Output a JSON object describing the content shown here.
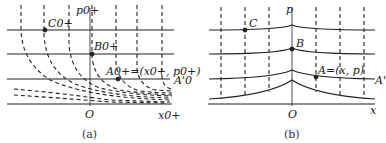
{
  "figure": {
    "panel_a": {
      "caption": "(a)",
      "axis_y_label": "p0+",
      "axis_x_label": "x0+",
      "origin_label": "O",
      "points": [
        {
          "name": "C0+",
          "label": "C0+"
        },
        {
          "name": "B0+",
          "label": "B0+"
        },
        {
          "name": "A0+",
          "label": "A0+=(x0+, p0+)"
        }
      ],
      "line_label": "A'0"
    },
    "panel_b": {
      "caption": "(b)",
      "axis_y_label": "p",
      "axis_x_label": "x",
      "origin_label": "O",
      "points": [
        {
          "name": "C",
          "label": "C"
        },
        {
          "name": "B",
          "label": "B"
        },
        {
          "name": "A",
          "label": "A=(x, p)"
        }
      ],
      "line_label": "A'"
    },
    "colors": {
      "ink": "#222222",
      "background": "#ffffff"
    }
  }
}
